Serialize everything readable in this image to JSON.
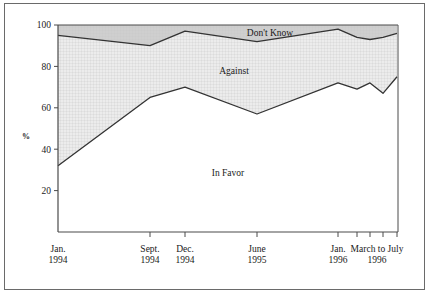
{
  "chart_data": {
    "type": "area",
    "title": "",
    "subtitle": "",
    "xlabel": "",
    "ylabel": "%",
    "ylim": [
      0,
      100
    ],
    "yticks": [
      20,
      40,
      60,
      80,
      100
    ],
    "ytick_labels": [
      "20",
      "40",
      "60",
      "80",
      "100"
    ],
    "grid": true,
    "grid_note": "fine dotted grid within shaded bands only",
    "legend_position": "inline-annotations",
    "stacked": true,
    "x": [
      0,
      1,
      2,
      3,
      4,
      5,
      6,
      7,
      8
    ],
    "x_pixels": [
      58,
      150,
      185,
      257,
      338,
      357,
      370,
      383,
      397
    ],
    "xtick_labels": [
      {
        "line1": "Jan.",
        "line2": "1994",
        "x_pixel": 58,
        "show_tick": false
      },
      {
        "line1": "Sept.",
        "line2": "1994",
        "x_pixel": 150,
        "show_tick": true
      },
      {
        "line1": "Dec.",
        "line2": "1994",
        "x_pixel": 185,
        "show_tick": true
      },
      {
        "line1": "June",
        "line2": "1995",
        "x_pixel": 257,
        "show_tick": true
      },
      {
        "line1": "Jan.",
        "line2": "1996",
        "x_pixel": 338,
        "show_tick": true
      },
      {
        "line1": "March to July",
        "line2": "1996",
        "x_pixel": 377,
        "show_tick": false
      }
    ],
    "minor_tick_pixels": [
      357,
      370,
      383,
      397
    ],
    "series": [
      {
        "name": "In Favor",
        "label": "In Favor",
        "values": [
          32,
          65,
          70,
          57,
          72,
          69,
          72,
          67,
          75
        ],
        "fill": "#ffffff",
        "label_x_pixel": 228,
        "label_y_pixel": 176
      },
      {
        "name": "Against",
        "label": "Against",
        "values": [
          63,
          25,
          27,
          35,
          26,
          25,
          21,
          27,
          21
        ],
        "fill": "#ececec",
        "label_x_pixel": 234,
        "label_y_pixel": 74
      },
      {
        "name": "Don't Know",
        "label": "Don't Know",
        "values": [
          5,
          10,
          3,
          8,
          2,
          6,
          7,
          6,
          4
        ],
        "fill": "#cfcfcf",
        "label_x_pixel": 270,
        "label_y_pixel": 36
      }
    ],
    "cumulative_boundaries": {
      "in_favor_top": [
        32,
        65,
        70,
        57,
        72,
        69,
        72,
        67,
        75
      ],
      "against_top": [
        95,
        90,
        97,
        92,
        98,
        94,
        93,
        94,
        96
      ],
      "dont_know_top": [
        100,
        100,
        100,
        100,
        100,
        100,
        100,
        100,
        100
      ]
    },
    "colors": {
      "in_favor_fill": "#ffffff",
      "against_fill": "#ececec",
      "dont_know_fill": "#cfcfcf",
      "line": "#333333",
      "axis": "#4a4a4a",
      "grid": "#c8c8c8",
      "frame": "#6a6a6a",
      "text": "#1a1a1a"
    },
    "plot_area": {
      "left": 58,
      "right": 398,
      "top": 25,
      "bottom": 232
    }
  }
}
